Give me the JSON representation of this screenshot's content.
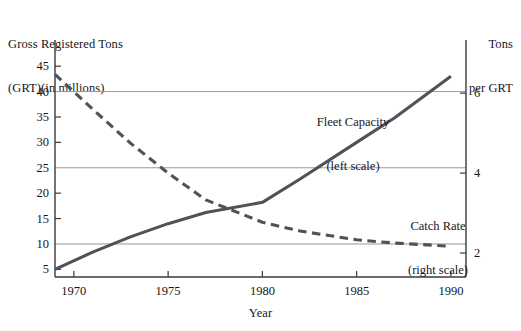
{
  "chart_data": {
    "type": "line",
    "title": "",
    "xlabel": "Year",
    "ylabel": "Gross Registered Tons (GRT)(in millions)",
    "y2label": "Tons per GRT",
    "xlim": [
      1969,
      1990.8
    ],
    "ylim": [
      3.5,
      47
    ],
    "y2lim": [
      1.4,
      6.93
    ],
    "grid": "horizontal gridlines at left values 10, 25, 40 (equal to right values 2, 4, 6)",
    "legend_position": "inline annotations beside each curve",
    "xticks": [
      1970,
      1975,
      1980,
      1985,
      1990
    ],
    "xticklabels": [
      "1970",
      "1975",
      "1980",
      "1985",
      "1990"
    ],
    "yticks": [
      5,
      10,
      15,
      20,
      25,
      30,
      35,
      40,
      45
    ],
    "yticklabels": [
      "5",
      "10",
      "15",
      "20",
      "25",
      "30",
      "35",
      "40",
      "45"
    ],
    "y2ticks": [
      2,
      4,
      6
    ],
    "y2ticklabels": [
      "2",
      "4",
      "6"
    ],
    "gridlines_left": [
      10,
      25,
      40
    ],
    "series": [
      {
        "name": "Fleet Capacity",
        "annotation": "Fleet Capacity\n(left scale)",
        "scale": "left",
        "style": "solid",
        "color": "#4f5358",
        "x": [
          1969,
          1971,
          1973,
          1975,
          1977,
          1980,
          1982,
          1985,
          1987,
          1990
        ],
        "values": [
          5.0,
          8.4,
          11.4,
          14.0,
          16.2,
          18.2,
          22.8,
          30.0,
          34.8,
          43.0
        ]
      },
      {
        "name": "Catch Rate",
        "annotation": "Catch Rate\n(right scale)",
        "scale": "right",
        "style": "dashed",
        "color": "#4f5358",
        "x": [
          1969,
          1971,
          1973,
          1975,
          1977,
          1980,
          1982,
          1985,
          1987,
          1990
        ],
        "values": [
          6.47,
          5.6,
          4.75,
          4.0,
          3.33,
          2.77,
          2.55,
          2.33,
          2.25,
          2.17
        ]
      }
    ]
  },
  "axes": {
    "left_title_line1": "Gross Registered Tons",
    "left_title_line2": "(GRT)(in millions)",
    "right_title_line1": "Tons",
    "right_title_line2": "per GRT",
    "x_title": "Year"
  },
  "annotations": {
    "fleet_line1": "Fleet Capacity",
    "fleet_line2": "(left scale)",
    "catch_line1": "Catch Rate",
    "catch_line2": "(right scale)"
  },
  "colors": {
    "line": "#4f5358",
    "axis": "#3a3a3a",
    "grid": "#9a9a9a",
    "text": "#16161a",
    "background": "#ffffff"
  }
}
